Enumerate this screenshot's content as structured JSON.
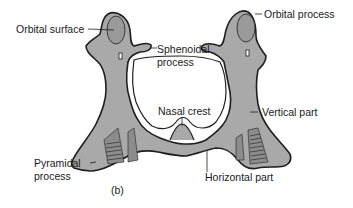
{
  "figure": {
    "panel_label": "(b)",
    "colors": {
      "bone_fill": "#a9a9a9",
      "bone_outline": "#1e1e1e",
      "shade": "#8c8c8c",
      "background": "#ffffff",
      "text": "#1a1a1a"
    },
    "labels": {
      "orbital_surface": "Orbital surface",
      "sphenoidal_process_line1": "Sphenoidal",
      "sphenoidal_process_line2": "process",
      "orbital_process": "Orbital process",
      "nasal_crest": "Nasal crest",
      "vertical_part": "Vertical part",
      "pyramidal_process_line1": "Pyramidal",
      "pyramidal_process_line2": "process",
      "horizontal_part": "Horizontal part"
    }
  }
}
